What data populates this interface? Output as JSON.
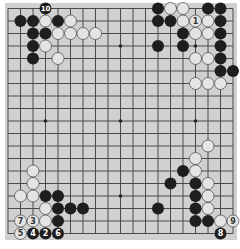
{
  "board": {
    "size": 19,
    "origin_x": 8,
    "origin_y": 8.5,
    "spacing": 12.5,
    "stone_radius": 6,
    "colors": {
      "background": "#d0d0d0",
      "line": "#4a4a4a",
      "black_stone": "#1e1e1e",
      "white_stone": "#e4e4e4",
      "white_stone_edge": "#555555",
      "label_on_black": "#ffffff",
      "label_on_white": "#333333"
    },
    "hoshi": [
      [
        3,
        3
      ],
      [
        9,
        3
      ],
      [
        15,
        3
      ],
      [
        3,
        9
      ],
      [
        9,
        9
      ],
      [
        15,
        9
      ],
      [
        3,
        15
      ],
      [
        9,
        15
      ],
      [
        15,
        15
      ]
    ]
  },
  "stones": [
    {
      "c": 3,
      "r": 0,
      "color": "B",
      "label": "10"
    },
    {
      "c": 1,
      "r": 1,
      "color": "B"
    },
    {
      "c": 2,
      "r": 1,
      "color": "B"
    },
    {
      "c": 3,
      "r": 1,
      "color": "W"
    },
    {
      "c": 4,
      "r": 1,
      "color": "B"
    },
    {
      "c": 5,
      "r": 1,
      "color": "W"
    },
    {
      "c": 2,
      "r": 2,
      "color": "B"
    },
    {
      "c": 3,
      "r": 2,
      "color": "B"
    },
    {
      "c": 4,
      "r": 2,
      "color": "W"
    },
    {
      "c": 5,
      "r": 2,
      "color": "W"
    },
    {
      "c": 6,
      "r": 2,
      "color": "W"
    },
    {
      "c": 7,
      "r": 2,
      "color": "W"
    },
    {
      "c": 2,
      "r": 3,
      "color": "B"
    },
    {
      "c": 3,
      "r": 3,
      "color": "W"
    },
    {
      "c": 2,
      "r": 4,
      "color": "B"
    },
    {
      "c": 4,
      "r": 4,
      "color": "W"
    },
    {
      "c": 12,
      "r": 0,
      "color": "B"
    },
    {
      "c": 13,
      "r": 0,
      "color": "W"
    },
    {
      "c": 14,
      "r": 0,
      "color": "W"
    },
    {
      "c": 16,
      "r": 0,
      "color": "B"
    },
    {
      "c": 17,
      "r": 0,
      "color": "B"
    },
    {
      "c": 12,
      "r": 1,
      "color": "B"
    },
    {
      "c": 13,
      "r": 1,
      "color": "B"
    },
    {
      "c": 14,
      "r": 1,
      "color": "W"
    },
    {
      "c": 15,
      "r": 1,
      "color": "W",
      "label": "1"
    },
    {
      "c": 16,
      "r": 1,
      "color": "W"
    },
    {
      "c": 17,
      "r": 1,
      "color": "B"
    },
    {
      "c": 14,
      "r": 2,
      "color": "B"
    },
    {
      "c": 15,
      "r": 2,
      "color": "W"
    },
    {
      "c": 16,
      "r": 2,
      "color": "W"
    },
    {
      "c": 17,
      "r": 2,
      "color": "B"
    },
    {
      "c": 12,
      "r": 3,
      "color": "B"
    },
    {
      "c": 14,
      "r": 3,
      "color": "B"
    },
    {
      "c": 17,
      "r": 3,
      "color": "B"
    },
    {
      "c": 15,
      "r": 4,
      "color": "W"
    },
    {
      "c": 16,
      "r": 4,
      "color": "W"
    },
    {
      "c": 17,
      "r": 4,
      "color": "B"
    },
    {
      "c": 17,
      "r": 5,
      "color": "B"
    },
    {
      "c": 18,
      "r": 5,
      "color": "B"
    },
    {
      "c": 15,
      "r": 6,
      "color": "W"
    },
    {
      "c": 16,
      "r": 6,
      "color": "W"
    },
    {
      "c": 17,
      "r": 6,
      "color": "W"
    },
    {
      "c": 2,
      "r": 13,
      "color": "W"
    },
    {
      "c": 2,
      "r": 14,
      "color": "W"
    },
    {
      "c": 1,
      "r": 15,
      "color": "W"
    },
    {
      "c": 2,
      "r": 15,
      "color": "W"
    },
    {
      "c": 3,
      "r": 15,
      "color": "B"
    },
    {
      "c": 4,
      "r": 15,
      "color": "B"
    },
    {
      "c": 3,
      "r": 16,
      "color": "W"
    },
    {
      "c": 4,
      "r": 16,
      "color": "B"
    },
    {
      "c": 5,
      "r": 16,
      "color": "B"
    },
    {
      "c": 6,
      "r": 16,
      "color": "B"
    },
    {
      "c": 1,
      "r": 17,
      "color": "W",
      "label": "7"
    },
    {
      "c": 2,
      "r": 17,
      "color": "W",
      "label": "3"
    },
    {
      "c": 3,
      "r": 17,
      "color": "W"
    },
    {
      "c": 4,
      "r": 17,
      "color": "B"
    },
    {
      "c": 1,
      "r": 18,
      "color": "W",
      "label": "5"
    },
    {
      "c": 2,
      "r": 18,
      "color": "B",
      "label": "4"
    },
    {
      "c": 3,
      "r": 18,
      "color": "B",
      "label": "2"
    },
    {
      "c": 4,
      "r": 18,
      "color": "B",
      "label": "6"
    },
    {
      "c": 16,
      "r": 11,
      "color": "W"
    },
    {
      "c": 15,
      "r": 12,
      "color": "W"
    },
    {
      "c": 14,
      "r": 13,
      "color": "B"
    },
    {
      "c": 15,
      "r": 13,
      "color": "W"
    },
    {
      "c": 13,
      "r": 14,
      "color": "B"
    },
    {
      "c": 15,
      "r": 14,
      "color": "B"
    },
    {
      "c": 16,
      "r": 14,
      "color": "W"
    },
    {
      "c": 15,
      "r": 15,
      "color": "B"
    },
    {
      "c": 16,
      "r": 15,
      "color": "W"
    },
    {
      "c": 12,
      "r": 16,
      "color": "B"
    },
    {
      "c": 15,
      "r": 16,
      "color": "B"
    },
    {
      "c": 16,
      "r": 16,
      "color": "W"
    },
    {
      "c": 15,
      "r": 17,
      "color": "B"
    },
    {
      "c": 16,
      "r": 17,
      "color": "B"
    },
    {
      "c": 17,
      "r": 17,
      "color": "W"
    },
    {
      "c": 18,
      "r": 17,
      "color": "W",
      "label": "9"
    },
    {
      "c": 17,
      "r": 18,
      "color": "B",
      "label": "8"
    }
  ]
}
